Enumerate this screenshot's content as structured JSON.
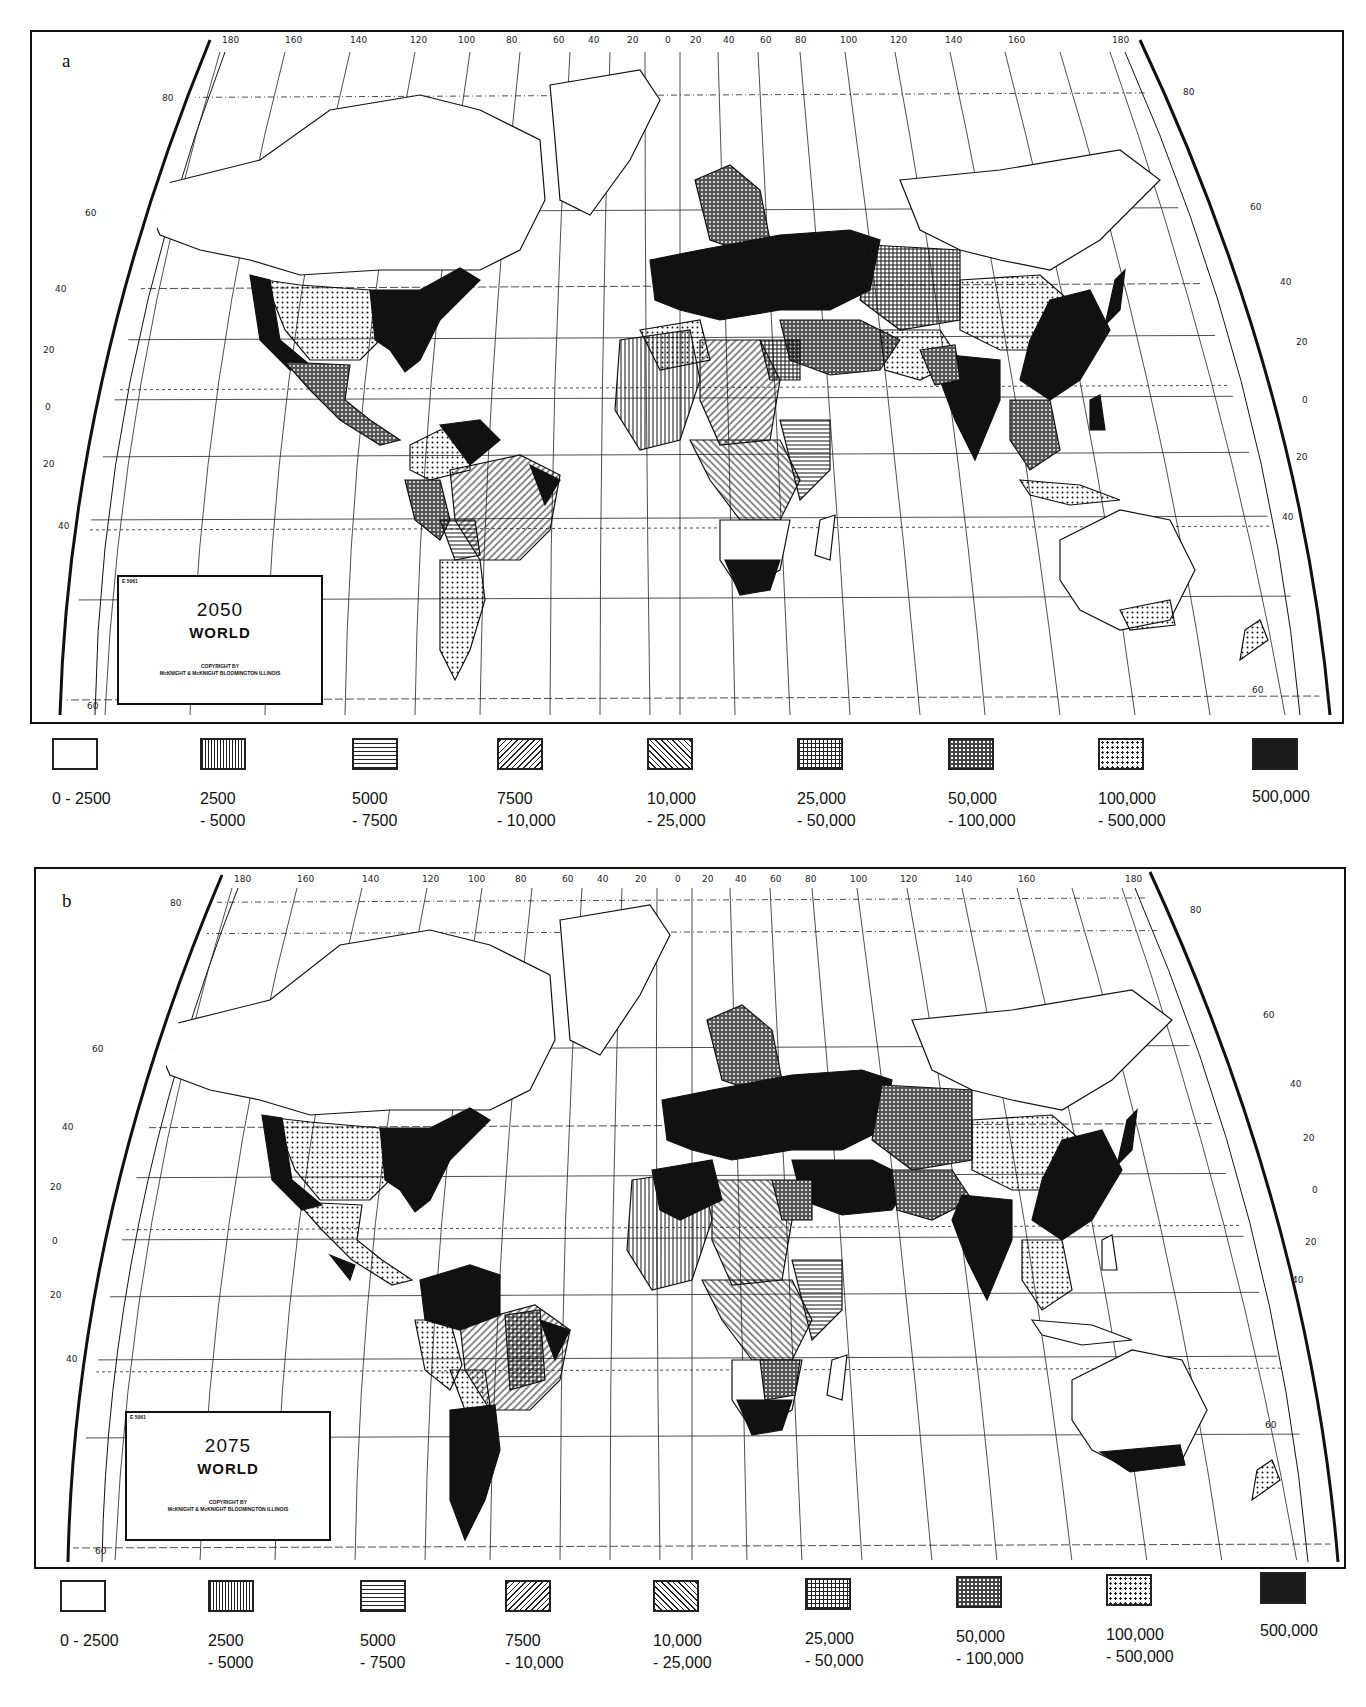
{
  "figure": {
    "panels": [
      {
        "letter": "a",
        "title_box": {
          "code": "E 5061",
          "year": "2050",
          "region": "WORLD",
          "copyright_line1": "COPYRIGHT BY",
          "copyright_line2": "McKNIGHT & McKNIGHT  BLOOMINGTON  ILLINOIS"
        },
        "longitude_labels": [
          "180",
          "160",
          "140",
          "120",
          "100",
          "80",
          "60",
          "40",
          "20",
          "0",
          "20",
          "40",
          "60",
          "80",
          "100",
          "120",
          "140",
          "160",
          "180"
        ],
        "latitude_labels_left": [
          "80",
          "60",
          "40",
          "20",
          "0",
          "20",
          "40",
          "60"
        ],
        "latitude_labels_right": [
          "80",
          "60",
          "40",
          "20",
          "0",
          "20",
          "40",
          "60"
        ]
      },
      {
        "letter": "b",
        "title_box": {
          "code": "E 5061",
          "year": "2075",
          "region": "WORLD",
          "copyright_line1": "COPYRIGHT BY",
          "copyright_line2": "McKNIGHT & McKNIGHT  BLOOMINGTON  ILLINOIS"
        },
        "longitude_labels": [
          "180",
          "160",
          "140",
          "120",
          "100",
          "80",
          "60",
          "40",
          "20",
          "0",
          "20",
          "40",
          "60",
          "80",
          "100",
          "120",
          "140",
          "160",
          "180"
        ],
        "latitude_labels_left": [
          "80",
          "60",
          "40",
          "20",
          "0",
          "20",
          "40",
          "60"
        ],
        "latitude_labels_right": [
          "80",
          "60",
          "40",
          "20",
          "0",
          "20",
          "40",
          "60"
        ]
      }
    ],
    "legend": [
      {
        "pattern": "blank",
        "line1": "0 - 2500",
        "line2": ""
      },
      {
        "pattern": "vertical-lines",
        "line1": "2500",
        "line2": "- 5000"
      },
      {
        "pattern": "horizontal-lines",
        "line1": "5000",
        "line2": "- 7500"
      },
      {
        "pattern": "diagonal-forward",
        "line1": "7500",
        "line2": "- 10,000"
      },
      {
        "pattern": "diagonal-backward",
        "line1": "10,000",
        "line2": "- 25,000"
      },
      {
        "pattern": "grid",
        "line1": "25,000",
        "line2": "- 50,000"
      },
      {
        "pattern": "dense-crosshatch",
        "line1": "50,000",
        "line2": "- 100,000"
      },
      {
        "pattern": "dots",
        "line1": "100,000",
        "line2": "- 500,000"
      },
      {
        "pattern": "solid-black",
        "line1": "500,000",
        "line2": ""
      }
    ],
    "colors": {
      "ink": "#111111",
      "paper": "#ffffff"
    }
  }
}
